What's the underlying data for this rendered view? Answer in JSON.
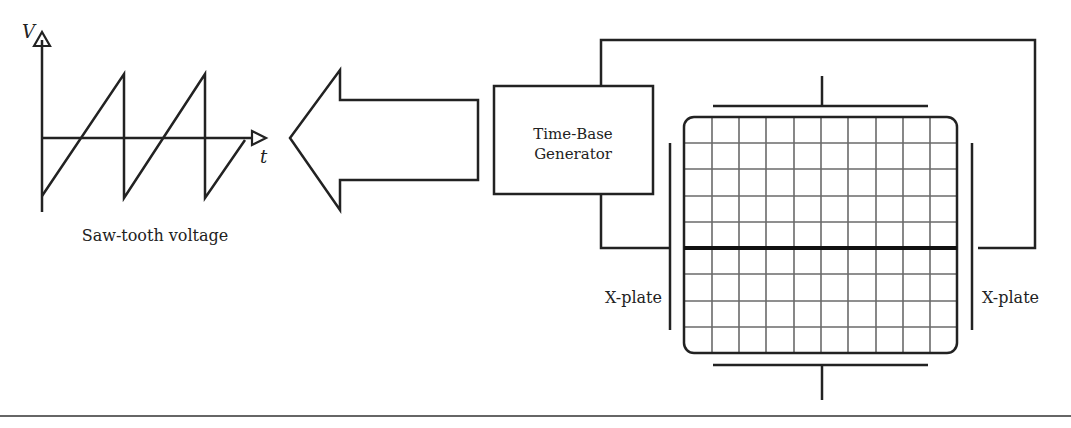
{
  "diagram": {
    "sawtooth": {
      "axis_v_label": "V",
      "axis_t_label": "t",
      "caption": "Saw-tooth voltage"
    },
    "generator": {
      "line1": "Time-Base",
      "line2": "Generator"
    },
    "screen": {
      "grid_cols": 10,
      "grid_rows": 9,
      "trace": "horizontal line"
    },
    "plates": {
      "left_label": "X-plate",
      "right_label": "X-plate"
    },
    "colors": {
      "ink": "#222222",
      "grid": "#6a6a6a"
    }
  }
}
